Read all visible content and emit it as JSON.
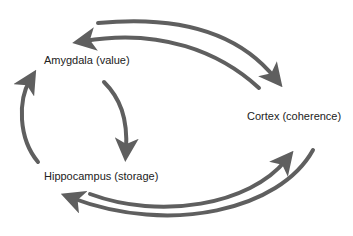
{
  "diagram": {
    "nodes": [
      {
        "id": "amygdala",
        "label": "Amygdala (value)"
      },
      {
        "id": "cortex",
        "label": "Cortex (coherence)"
      },
      {
        "id": "hippocampus",
        "label": "Hippocampus (storage)"
      }
    ],
    "edges": [
      {
        "from": "cortex",
        "to": "amygdala",
        "style": "curved-arrow"
      },
      {
        "from": "amygdala",
        "to": "cortex",
        "style": "curved-arrow"
      },
      {
        "from": "amygdala",
        "to": "hippocampus",
        "style": "curved-arrow"
      },
      {
        "from": "hippocampus",
        "to": "amygdala",
        "style": "curved-arrow"
      },
      {
        "from": "hippocampus",
        "to": "cortex",
        "style": "curved-arrow"
      },
      {
        "from": "cortex",
        "to": "hippocampus",
        "style": "curved-arrow"
      }
    ],
    "colors": {
      "arrow": "#5f5f5f",
      "text": "#222222",
      "background": "#ffffff"
    }
  }
}
